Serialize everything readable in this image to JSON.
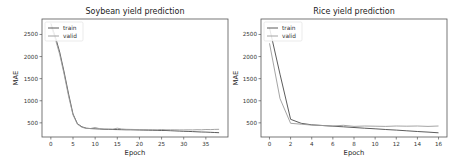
{
  "colors": {
    "train": "#4a4a4a",
    "valid": "#9a9a9a",
    "axis": "#555555",
    "legend_border": "#dddddd"
  },
  "chart_data": [
    {
      "type": "line",
      "title": "Soybean yield prediction",
      "xlabel": "Epoch",
      "ylabel": "MAE",
      "xlim": [
        -2,
        40
      ],
      "ylim": [
        180,
        2850
      ],
      "xticks": [
        0,
        5,
        10,
        15,
        20,
        25,
        30,
        35
      ],
      "yticks": [
        500,
        1000,
        1500,
        2000,
        2500
      ],
      "grid": false,
      "legend_position": "upper left",
      "x": [
        0,
        1,
        2,
        3,
        4,
        5,
        6,
        7,
        8,
        9,
        10,
        11,
        12,
        13,
        14,
        15,
        16,
        17,
        18,
        19,
        20,
        21,
        22,
        23,
        24,
        25,
        26,
        27,
        28,
        29,
        30,
        31,
        32,
        33,
        34,
        35,
        36,
        37,
        38
      ],
      "series": [
        {
          "name": "train",
          "values": [
            2750,
            2450,
            2100,
            1650,
            1150,
            700,
            480,
            410,
            380,
            370,
            365,
            360,
            355,
            352,
            350,
            348,
            346,
            344,
            342,
            340,
            338,
            336,
            334,
            332,
            330,
            328,
            326,
            322,
            318,
            314,
            310,
            306,
            302,
            298,
            294,
            290,
            286,
            282,
            278
          ]
        },
        {
          "name": "valid",
          "values": [
            2700,
            2400,
            2050,
            1600,
            1100,
            680,
            470,
            400,
            375,
            372,
            395,
            368,
            360,
            362,
            358,
            380,
            360,
            355,
            352,
            350,
            348,
            347,
            346,
            345,
            344,
            350,
            343,
            342,
            342,
            341,
            340,
            342,
            340,
            345,
            344,
            350,
            348,
            352,
            355
          ]
        }
      ]
    },
    {
      "type": "line",
      "title": "Rice yield prediction",
      "xlabel": "Epoch",
      "ylabel": "MAE",
      "xlim": [
        -0.8,
        16.8
      ],
      "ylim": [
        180,
        2850
      ],
      "xticks": [
        0,
        2,
        4,
        6,
        8,
        10,
        12,
        14,
        16
      ],
      "yticks": [
        500,
        1000,
        1500,
        2000,
        2500
      ],
      "grid": false,
      "legend_position": "upper left",
      "x": [
        0,
        1,
        2,
        3,
        4,
        5,
        6,
        7,
        8,
        9,
        10,
        11,
        12,
        13,
        14,
        15,
        16
      ],
      "series": [
        {
          "name": "train",
          "values": [
            2650,
            1600,
            580,
            490,
            455,
            440,
            425,
            410,
            395,
            380,
            365,
            350,
            335,
            320,
            305,
            290,
            275
          ]
        },
        {
          "name": "valid",
          "values": [
            2300,
            1050,
            490,
            470,
            450,
            440,
            430,
            445,
            420,
            430,
            425,
            420,
            430,
            425,
            430,
            420,
            430
          ]
        }
      ]
    }
  ]
}
